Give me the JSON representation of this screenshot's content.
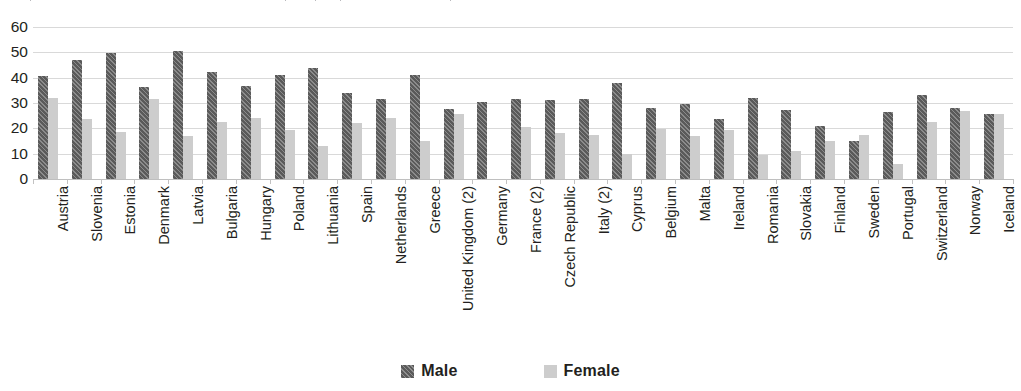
{
  "chart_data": {
    "type": "bar",
    "title": "",
    "subtitle": "",
    "xlabel": "",
    "ylabel": "",
    "ylim": [
      0,
      60
    ],
    "yticks": [
      0,
      10,
      20,
      30,
      40,
      50,
      60
    ],
    "ytick_labels": [
      "0",
      "10",
      "20",
      "30",
      "40",
      "50",
      "60"
    ],
    "grid": true,
    "legend_position": "bottom-center",
    "categories": [
      "Austria",
      "Slovenia",
      "Estonia",
      "Denmark",
      "Latvia",
      "Bulgaria",
      "Hungary",
      "Poland",
      "Lithuania",
      "Spain",
      "Netherlands",
      "Greece",
      "United Kingdom (2)",
      "Germany",
      "France (2)",
      "Czech Republic",
      "Italy (2)",
      "Cyprus",
      "Belgium",
      "Malta",
      "Ireland",
      "Romania",
      "Slovakia",
      "Finland",
      "Sweden",
      "Portugal",
      "Switzerland",
      "Norway",
      "Iceland"
    ],
    "series": [
      {
        "name": "Male",
        "color": "#5a5a5a",
        "pattern": "diagonal-hatch",
        "values": [
          40.5,
          47.0,
          49.8,
          36.2,
          50.5,
          42.3,
          36.8,
          41.2,
          43.8,
          33.8,
          31.5,
          41.0,
          27.5,
          30.5,
          31.5,
          31.2,
          31.5,
          38.0,
          28.0,
          29.8,
          23.8,
          31.8,
          27.2,
          21.0,
          15.2,
          26.5,
          33.2,
          28.0,
          25.8
        ]
      },
      {
        "name": "Female",
        "color": "#cdcdcd",
        "pattern": "solid",
        "values": [
          31.8,
          23.5,
          18.5,
          31.5,
          16.8,
          22.5,
          24.2,
          19.5,
          13.0,
          22.0,
          24.2,
          15.0,
          25.5,
          0.0,
          20.5,
          18.0,
          17.5,
          9.8,
          19.8,
          17.0,
          19.5,
          9.3,
          11.0,
          15.2,
          17.5,
          5.8,
          22.5,
          27.0,
          25.5
        ]
      }
    ]
  },
  "legend": {
    "items": [
      {
        "label": "Male"
      },
      {
        "label": "Female"
      }
    ]
  }
}
